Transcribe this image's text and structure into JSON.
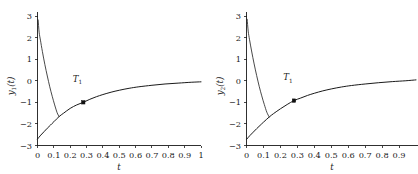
{
  "figure": {
    "background": "#ffffff",
    "ink_color": "#1a1a1a",
    "panel_count": 2
  },
  "chart_data": [
    {
      "type": "line",
      "title": "",
      "xlabel": "t",
      "ylabel": "y₁(t)",
      "ylabel_plain": "y1(t)",
      "xlim": [
        0,
        1
      ],
      "ylim": [
        -3,
        3
      ],
      "xticks": [
        0,
        0.1,
        0.2,
        0.3,
        0.4,
        0.5,
        0.6,
        0.7,
        0.8,
        0.9,
        1
      ],
      "xticklabels": [
        "0",
        "0.1",
        "0.2",
        "0.3",
        "0.4",
        "0.5",
        "0.6",
        "0.7",
        "0.8",
        "0.9",
        "1"
      ],
      "yticks": [
        -3,
        -2,
        -1,
        0,
        1,
        2,
        3
      ],
      "yticklabels": [
        "−3",
        "−2",
        "−1",
        "0",
        "1",
        "2",
        "3"
      ],
      "grid": false,
      "legend": null,
      "legend_position": "none",
      "series": [
        {
          "name": "spike-branch",
          "comment": "steep descending branch from near +2.8 at t~0.005 down to the crossing point",
          "x": [
            0.004,
            0.01,
            0.018,
            0.03,
            0.045,
            0.06,
            0.075,
            0.09,
            0.105,
            0.12,
            0.132
          ],
          "y": [
            2.82,
            2.25,
            1.88,
            1.35,
            0.75,
            0.22,
            -0.28,
            -0.72,
            -1.12,
            -1.48,
            -1.66
          ]
        },
        {
          "name": "relaxation-branch",
          "comment": "smooth rising curve from -2.70 at t=0 asymptoting toward 0",
          "x": [
            0.0,
            0.02,
            0.04,
            0.06,
            0.08,
            0.1,
            0.132,
            0.16,
            0.2,
            0.24,
            0.28,
            0.32,
            0.36,
            0.4,
            0.45,
            0.5,
            0.56,
            0.62,
            0.7,
            0.78,
            0.86,
            0.94,
            1.0
          ],
          "y": [
            -2.7,
            -2.52,
            -2.36,
            -2.2,
            -2.05,
            -1.9,
            -1.66,
            -1.5,
            -1.28,
            -1.12,
            -1.0,
            -0.86,
            -0.74,
            -0.64,
            -0.53,
            -0.44,
            -0.35,
            -0.28,
            -0.21,
            -0.15,
            -0.11,
            -0.07,
            -0.05
          ]
        }
      ],
      "annotations": [
        {
          "label": "T₁",
          "label_base": "T",
          "label_sub": "1",
          "marker_x": 0.28,
          "marker_y": -1.0,
          "marker_shape": "filled-square",
          "text_x": 0.245,
          "text_y": -0.05
        }
      ]
    },
    {
      "type": "line",
      "title": "",
      "xlabel": "t",
      "ylabel": "y₂(t)",
      "ylabel_plain": "y2(t)",
      "xlim": [
        0,
        1
      ],
      "ylim": [
        -3,
        3
      ],
      "xticks": [
        0,
        0.1,
        0.2,
        0.3,
        0.4,
        0.5,
        0.6,
        0.7,
        0.8,
        0.9
      ],
      "xticklabels": [
        "0",
        "0.1",
        "0.2",
        "0.3",
        "0.4",
        "0.5",
        "0.6",
        "0.7",
        "0.8",
        "0.9"
      ],
      "yticks": [
        -3,
        -2,
        -1,
        0,
        1,
        2,
        3
      ],
      "yticklabels": [
        "−3",
        "−2",
        "−1",
        "0",
        "1",
        "2",
        "3"
      ],
      "grid": false,
      "legend": null,
      "legend_position": "none",
      "series": [
        {
          "name": "spike-branch",
          "comment": "steep descending branch from near +2.85 at t~0.005 down to the crossing point",
          "x": [
            0.004,
            0.01,
            0.018,
            0.03,
            0.045,
            0.06,
            0.075,
            0.09,
            0.105,
            0.12,
            0.134
          ],
          "y": [
            2.85,
            2.3,
            1.9,
            1.38,
            0.78,
            0.24,
            -0.26,
            -0.7,
            -1.1,
            -1.46,
            -1.68
          ]
        },
        {
          "name": "relaxation-branch",
          "comment": "smooth rising curve from -2.72 at t=0 asymptoting toward 0",
          "x": [
            0.0,
            0.02,
            0.04,
            0.06,
            0.08,
            0.1,
            0.134,
            0.16,
            0.2,
            0.24,
            0.28,
            0.32,
            0.36,
            0.4,
            0.45,
            0.5,
            0.56,
            0.62,
            0.7,
            0.78,
            0.86,
            0.94,
            1.0
          ],
          "y": [
            -2.72,
            -2.54,
            -2.38,
            -2.22,
            -2.07,
            -1.92,
            -1.68,
            -1.52,
            -1.3,
            -1.1,
            -0.92,
            -0.8,
            -0.68,
            -0.58,
            -0.47,
            -0.38,
            -0.29,
            -0.22,
            -0.15,
            -0.09,
            -0.04,
            0.0,
            0.04
          ]
        }
      ],
      "annotations": [
        {
          "label": "T₁",
          "label_base": "T",
          "label_sub": "1",
          "marker_x": 0.28,
          "marker_y": -0.92,
          "marker_shape": "filled-square",
          "text_x": 0.245,
          "text_y": 0.02
        }
      ]
    }
  ]
}
